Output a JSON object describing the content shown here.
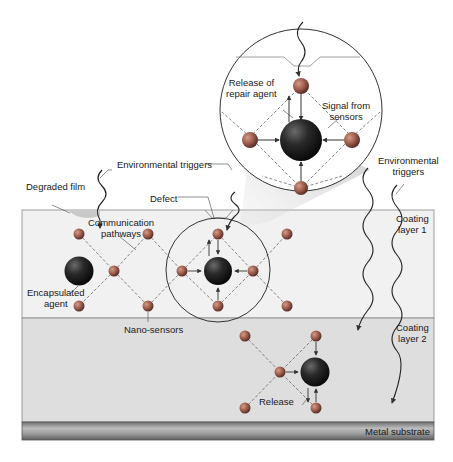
{
  "diagram": {
    "labels": {
      "release_repair_line1": "Release of",
      "release_repair_line2": "repair agent",
      "signal_line1": "Signal from",
      "signal_line2": "sensors",
      "env_triggers_left": "Environmental triggers",
      "env_triggers_right_line1": "Environmental",
      "env_triggers_right_line2": "triggers",
      "degraded_film": "Degraded film",
      "defect": "Defect",
      "comm_line1": "Communication",
      "comm_line2": "pathways",
      "encap_line1": "Encapsulated",
      "encap_line2": "agent",
      "nano_sensors": "Nano-sensors",
      "coating1_line1": "Coating",
      "coating1_line2": "layer 1",
      "coating2_line1": "Coating",
      "coating2_line2": "layer 2",
      "release": "Release",
      "metal_substrate": "Metal substrate"
    },
    "layers": [
      {
        "name": "Coating layer 1",
        "color": "#f0f0f0"
      },
      {
        "name": "Coating layer 2",
        "color": "#dcdcdc"
      },
      {
        "name": "Metal substrate",
        "color": "#8a8a8a"
      }
    ],
    "colors": {
      "sensor": "#9a5a4a",
      "agent": "#222222",
      "line": "#444444"
    }
  }
}
